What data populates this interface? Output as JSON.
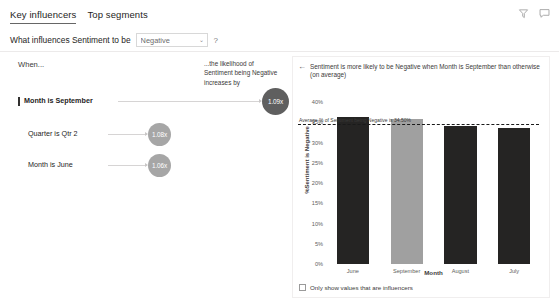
{
  "header": {
    "tabs": [
      {
        "label": "Key influencers",
        "active": true
      },
      {
        "label": "Top segments",
        "active": false
      }
    ],
    "icons": [
      {
        "name": "filter-icon"
      },
      {
        "name": "comment-icon"
      }
    ]
  },
  "question": {
    "prefix": "What influences Sentiment to be",
    "dropdown_value": "Negative",
    "dropdown_caret": "⌄",
    "help": "?"
  },
  "left_panel": {
    "when_label": "When...",
    "likelihood_label": "...the likelihood of Sentiment being Negative increases by",
    "influencers": [
      {
        "label": "Month is September",
        "value": "1.09x",
        "selected": true
      },
      {
        "label": "Quarter is Qtr 2",
        "value": "1.08x",
        "selected": false
      },
      {
        "label": "Month is June",
        "value": "1.06x",
        "selected": false
      }
    ]
  },
  "chart_panel": {
    "back_arrow": "←",
    "title": "Sentiment is more likely to be Negative when Month is September than otherwise (on average)",
    "checkbox_label": "Only show values that are influencers",
    "checkbox_checked": false
  },
  "chart_data": {
    "type": "bar",
    "title": "Sentiment is more likely to be Negative when Month is September than otherwise (on average)",
    "categories": [
      "June",
      "September",
      "August",
      "July"
    ],
    "values": [
      36.3,
      35.8,
      34.2,
      33.6
    ],
    "highlight_category": "September",
    "xlabel": "Month",
    "ylabel": "%Sentiment is Negative",
    "ylim": [
      0,
      40
    ],
    "yticks": [
      40,
      35,
      30,
      25,
      20,
      15,
      10,
      5,
      0
    ],
    "ytick_labels": [
      "40%",
      "35%",
      "30%",
      "25%",
      "20%",
      "15%",
      "10%",
      "5%",
      "0%"
    ],
    "grid": false,
    "legend": "none",
    "annotations": [
      {
        "type": "average-line",
        "label": "Average % of Sentiment being Negative is 34.50%",
        "value": 34.5
      }
    ],
    "colors": {
      "bar": "#252423",
      "bar_highlight": "#a0a0a0",
      "average_line": "#1a1a1a"
    }
  }
}
